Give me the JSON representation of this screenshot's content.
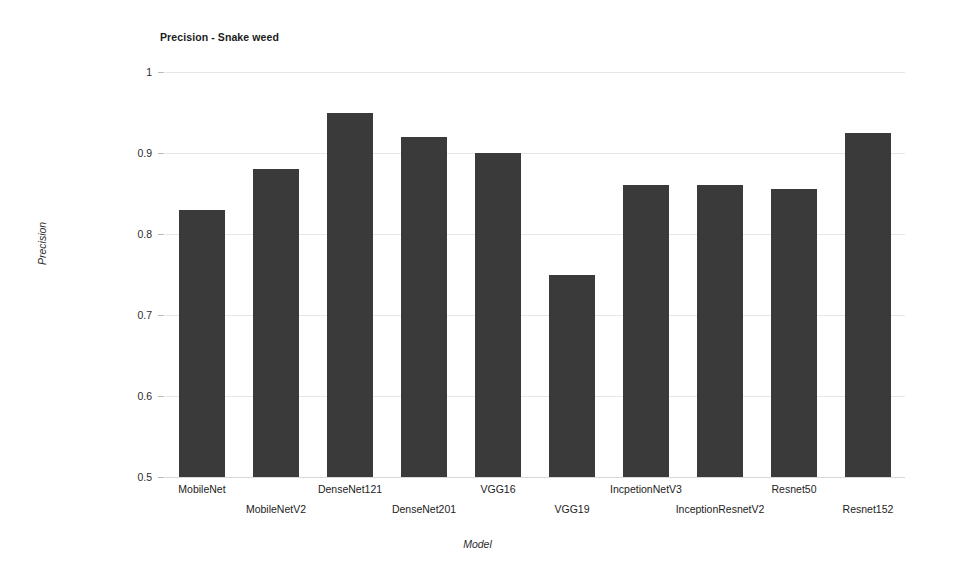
{
  "chart_data": {
    "type": "bar",
    "title": "Precision - Snake weed",
    "xlabel": "Model",
    "ylabel": "Precision",
    "ylim": [
      0.5,
      1
    ],
    "yticks": [
      "0.5",
      "0.6",
      "0.7",
      "0.8",
      "0.9",
      "1"
    ],
    "ytick_values": [
      0.5,
      0.6,
      0.7,
      0.8,
      0.9,
      1
    ],
    "grid": true,
    "legend": "none",
    "bar_color": "#3a3a3a",
    "gridline_color": "#e6e6e6",
    "categories": [
      "MobileNet",
      "MobileNetV2",
      "DenseNet121",
      "DenseNet201",
      "VGG16",
      "VGG19",
      "IncpetionNetV3",
      "InceptionResnetV2",
      "Resnet50",
      "Resnet152"
    ],
    "values": [
      0.83,
      0.88,
      0.95,
      0.92,
      0.9,
      0.75,
      0.86,
      0.86,
      0.855,
      0.925
    ]
  }
}
